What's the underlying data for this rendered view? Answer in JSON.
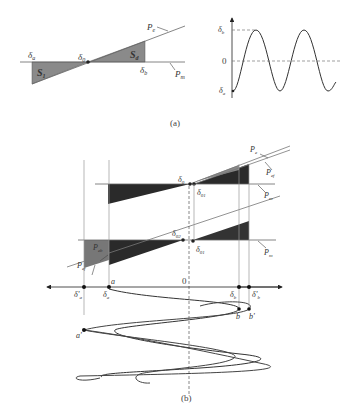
{
  "figure_a": {
    "caption": "(a)",
    "left_panel": {
      "labels": {
        "delta_a": "δ",
        "delta_a_sub": "a",
        "delta_0": "δ",
        "delta_0_sub": "0",
        "delta_b": "δ",
        "delta_b_sub": "b",
        "S1": "S",
        "S1_sub": "1",
        "Sd": "S",
        "Sd_sub": "d",
        "Pe": "P",
        "Pe_sub": "e",
        "Pm": "P",
        "Pm_sub": "m"
      }
    },
    "right_panel": {
      "y_labels": {
        "top": "δ",
        "top_sub": "b",
        "mid": "0",
        "bottom": "δ",
        "bottom_sub": "a"
      }
    }
  },
  "figure_b": {
    "caption": "(b)",
    "labels": {
      "delta0": "δ",
      "delta0_sub": "0",
      "delta01_upper": "δ",
      "delta01_upper_sub": "01",
      "delta02": "δ",
      "delta02_sub": "02",
      "delta01_lower": "δ",
      "delta01_lower_sub": "01",
      "Pe": "P",
      "Pe_sub": "e",
      "Pef_upper": "P",
      "Pef_upper_sub": "ef",
      "Pm_upper": "P",
      "Pm_upper_sub": "m",
      "Pm_lower": "P",
      "Pm_lower_sub": "m",
      "Peb": "P",
      "Peb_sub": "eb",
      "Pef_lower": "P",
      "Pef_lower_sub": "ef",
      "zero": "0",
      "a": "a",
      "a_prime": "a'",
      "b": "b",
      "b_prime": "b'",
      "delta_a": "δ",
      "delta_a_sub": "a",
      "delta_a_prime": "δ'",
      "delta_a_prime_sub": "a",
      "delta_b": "δ",
      "delta_b_sub": "b",
      "delta_b_prime": "δ'",
      "delta_b_prime_sub": "b"
    }
  }
}
